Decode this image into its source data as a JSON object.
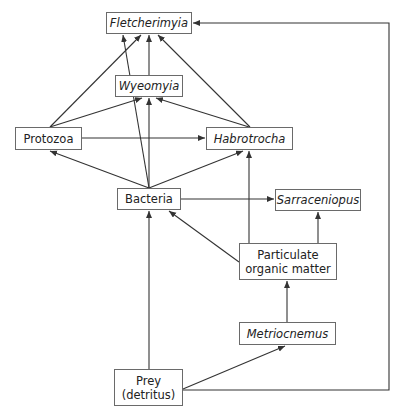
{
  "diagram": {
    "type": "food-web",
    "nodes": [
      {
        "id": "fletcherimyia",
        "label": "Fletcherimyia",
        "italic": true,
        "box": [
          106,
          12,
          86,
          22
        ]
      },
      {
        "id": "wyeomyia",
        "label": "Wyeomyia",
        "italic": true,
        "box": [
          115,
          75,
          68,
          22
        ]
      },
      {
        "id": "protozoa",
        "label": "Protozoa",
        "italic": false,
        "box": [
          15,
          127,
          67,
          23
        ]
      },
      {
        "id": "habrotrocha",
        "label": "Habrotrocha",
        "italic": true,
        "box": [
          206,
          127,
          87,
          23
        ]
      },
      {
        "id": "bacteria",
        "label": "Bacteria",
        "italic": false,
        "box": [
          117,
          188,
          64,
          22
        ]
      },
      {
        "id": "sarraceniopus",
        "label": "Sarraceniopus",
        "italic": true,
        "box": [
          275,
          189,
          86,
          22
        ]
      },
      {
        "id": "pom",
        "label_line1": "Particulate",
        "label_line2": "organic matter",
        "italic": false,
        "box": [
          239,
          243,
          98,
          37
        ]
      },
      {
        "id": "metriocnemus",
        "label": "Metriocnemus",
        "italic": true,
        "box": [
          239,
          322,
          97,
          23
        ]
      },
      {
        "id": "prey",
        "label_line1": "Prey",
        "label_line2": "(detritus)",
        "italic": false,
        "box": [
          114,
          369,
          69,
          37
        ]
      }
    ],
    "edges": [
      {
        "from": "protozoa",
        "to": "fletcherimyia",
        "points": [
          [
            50,
            127
          ],
          [
            141,
            35
          ]
        ]
      },
      {
        "from": "bacteria",
        "to": "fletcherimyia",
        "points": [
          [
            149,
            188
          ],
          [
            123,
            35
          ]
        ]
      },
      {
        "from": "wyeomyia",
        "to": "fletcherimyia",
        "points": [
          [
            149,
            75
          ],
          [
            149,
            35
          ]
        ]
      },
      {
        "from": "habrotrocha",
        "to": "fletcherimyia",
        "points": [
          [
            250,
            127
          ],
          [
            158,
            35
          ]
        ]
      },
      {
        "from": "protozoa",
        "to": "wyeomyia",
        "points": [
          [
            50,
            127
          ],
          [
            142,
            98
          ]
        ]
      },
      {
        "from": "bacteria",
        "to": "wyeomyia",
        "points": [
          [
            149,
            188
          ],
          [
            149,
            98
          ]
        ]
      },
      {
        "from": "habrotrocha",
        "to": "wyeomyia",
        "points": [
          [
            249,
            127
          ],
          [
            156,
            98
          ]
        ]
      },
      {
        "from": "protozoa",
        "to": "habrotrocha",
        "points": [
          [
            82,
            138
          ],
          [
            205,
            138
          ]
        ]
      },
      {
        "from": "bacteria",
        "to": "protozoa",
        "points": [
          [
            149,
            188
          ],
          [
            50,
            151
          ]
        ]
      },
      {
        "from": "bacteria",
        "to": "habrotrocha",
        "points": [
          [
            149,
            188
          ],
          [
            243,
            151
          ]
        ]
      },
      {
        "from": "bacteria",
        "to": "sarraceniopus",
        "points": [
          [
            181,
            199
          ],
          [
            274,
            199
          ]
        ]
      },
      {
        "from": "pom",
        "to": "habrotrocha",
        "points": [
          [
            249,
            243
          ],
          [
            249,
            151
          ]
        ]
      },
      {
        "from": "pom",
        "to": "bacteria",
        "points": [
          [
            239,
            262
          ],
          [
            169,
            211
          ]
        ]
      },
      {
        "from": "pom",
        "to": "sarraceniopus",
        "points": [
          [
            318,
            243
          ],
          [
            318,
            212
          ]
        ]
      },
      {
        "from": "metriocnemus",
        "to": "pom",
        "points": [
          [
            287,
            322
          ],
          [
            287,
            281
          ]
        ]
      },
      {
        "from": "prey",
        "to": "bacteria",
        "points": [
          [
            149,
            369
          ],
          [
            149,
            211
          ]
        ]
      },
      {
        "from": "prey",
        "to": "metriocnemus",
        "points": [
          [
            183,
            389
          ],
          [
            285,
            346
          ]
        ]
      },
      {
        "from": "prey",
        "to": "fletcherimyia",
        "points": [
          [
            183,
            390
          ],
          [
            389,
            390
          ],
          [
            389,
            23
          ],
          [
            193,
            23
          ]
        ]
      }
    ],
    "colors": {
      "line": "#333333",
      "box_border": "#6a6a6a",
      "text": "#222222",
      "background": "#ffffff"
    }
  }
}
